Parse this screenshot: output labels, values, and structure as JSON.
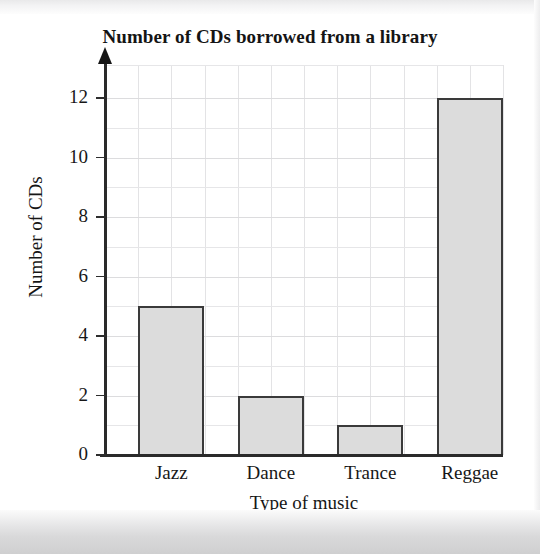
{
  "chart_data": {
    "type": "bar",
    "title": "Number of CDs borrowed from a library",
    "xlabel": "Type of music",
    "ylabel": "Number of CDs",
    "categories": [
      "Jazz",
      "Dance",
      "Trance",
      "Reggae"
    ],
    "values": [
      5,
      2,
      1,
      12
    ],
    "ylim": [
      0,
      12
    ],
    "ytick_labels": [
      "0",
      "2",
      "4",
      "6",
      "8",
      "10",
      "12"
    ],
    "ytick_values": [
      0,
      2,
      4,
      6,
      8,
      10,
      12
    ],
    "y_minor_step": 1,
    "grid": true,
    "legend": "none",
    "bar_fill_color": "#dcdcdc",
    "bar_edge_color": "#3a3a3a",
    "axis_color": "#2a2a2a",
    "grid_color": "#e3e3e5",
    "background_color": "#ffffff"
  }
}
